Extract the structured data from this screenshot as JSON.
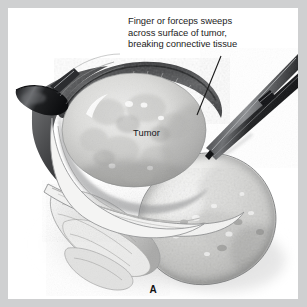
{
  "figure": {
    "panel_label": "A",
    "callout": "Finger or forceps sweeps\nacross surface of tumor,\nbreaking connective tissue",
    "tumor_label": "Tumor",
    "frame_color": "#cfd0d1",
    "canvas_color": "#ffffff",
    "ink_color": "#1c1c1c"
  },
  "annotations": [
    {
      "name": "callout-text",
      "text": "Finger or forceps sweeps\nacross surface of tumor,\nbreaking connective tissue"
    },
    {
      "name": "tumor-label",
      "text": "Tumor"
    },
    {
      "name": "panel-label",
      "text": "A"
    }
  ],
  "leader_line": {
    "from_x": 213,
    "from_y": 55,
    "to_x": 189,
    "to_y": 108,
    "color": "#1a1a1a",
    "width": 1.1
  },
  "instruments": [
    {
      "name": "forceps",
      "description": "long two-bladed forceps entering from upper right, tips meeting tumor surface",
      "color": "#2a2b2e"
    },
    {
      "name": "retractor",
      "description": "dark retractor tip at left margin lifting the tissue edge",
      "color": "#232427"
    }
  ],
  "anatomy": [
    {
      "name": "tumor-mass",
      "label": "Tumor",
      "tone": "#d8d8d6"
    },
    {
      "name": "capsule-rim",
      "description": "dark textured rim arcing over the tumor",
      "tone": "#4e4e50"
    },
    {
      "name": "organ-mass-right",
      "description": "large rounded pale tissue mass lower right",
      "tone": "#dedede"
    },
    {
      "name": "fibrous-bands-lower-left",
      "description": "pale fibrous/muscular bands",
      "tone": "#e7e7e7"
    },
    {
      "name": "cavity-shadow",
      "description": "shadowed opened cavity beneath retracted edge",
      "tone": "#9a9a9c"
    }
  ],
  "palette": {
    "darkest": "#1c1d20",
    "dark": "#4a4b4e",
    "mid": "#8d8e90",
    "light": "#c9c9c8",
    "lightest": "#f2f2f1",
    "frame": "#cfd0d1"
  }
}
